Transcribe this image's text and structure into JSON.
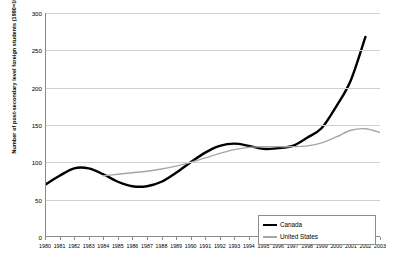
{
  "chart_data": {
    "type": "line",
    "title": "",
    "xlabel": "",
    "ylabel": "Number of post-secondary level foreign students (1990=100)",
    "xlim": [
      1980,
      2003
    ],
    "ylim": [
      0,
      300
    ],
    "yticks": [
      0,
      50,
      100,
      150,
      200,
      250,
      300
    ],
    "grid": "horizontal",
    "legend_position": "bottom-right",
    "x": [
      1980,
      1981,
      1982,
      1983,
      1984,
      1985,
      1986,
      1987,
      1988,
      1989,
      1990,
      1991,
      1992,
      1993,
      1994,
      1995,
      1996,
      1997,
      1998,
      1999,
      2000,
      2001,
      2002,
      2003
    ],
    "categories": [
      "1980",
      "1981",
      "1982",
      "1983",
      "1984",
      "1985",
      "1986",
      "1987",
      "1988",
      "1989",
      "1990",
      "1991",
      "1992",
      "1993",
      "1994",
      "1995",
      "1996",
      "1997",
      "1998",
      "1999",
      "2000",
      "2001",
      "2002",
      "2003"
    ],
    "series": [
      {
        "name": "Canada",
        "color": "#000000",
        "width": 2.4,
        "values": [
          70,
          82,
          92,
          92,
          84,
          74,
          68,
          68,
          74,
          86,
          100,
          113,
          122,
          125,
          122,
          118,
          119,
          122,
          133,
          146,
          175,
          210,
          268,
          null
        ]
      },
      {
        "name": "United States",
        "color": "#a6a6a6",
        "width": 1.4,
        "values": [
          null,
          null,
          null,
          null,
          82,
          84,
          86,
          88,
          91,
          95,
          100,
          106,
          112,
          117,
          120,
          121,
          121,
          121,
          122,
          126,
          134,
          143,
          145,
          140
        ]
      }
    ]
  },
  "legend": {
    "items": [
      {
        "label": "Canada"
      },
      {
        "label": "United States"
      }
    ]
  },
  "axis": {
    "y_title": "Number of post-secondary level foreign students (1990=100)"
  }
}
